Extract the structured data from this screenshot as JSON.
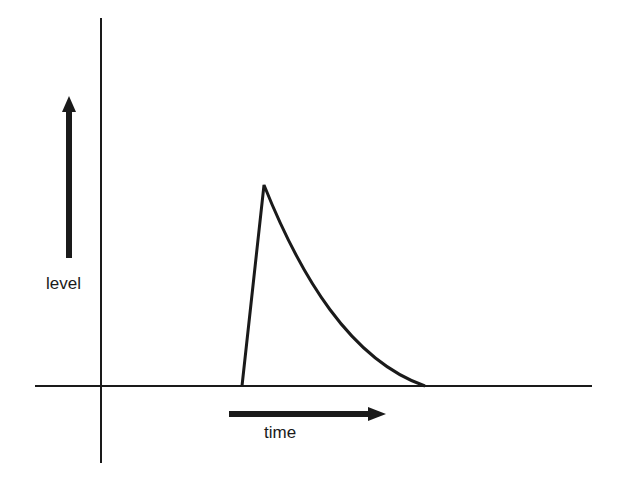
{
  "diagram": {
    "type": "pulse-level-over-time",
    "labels": {
      "y_axis": "level",
      "x_axis": "time"
    },
    "axes": {
      "vertical": {
        "x": 101,
        "y1": 18,
        "y2": 463
      },
      "horizontal": {
        "y": 386,
        "x1": 35,
        "x2": 592
      }
    },
    "pulse": {
      "start": [
        242,
        386
      ],
      "peak": [
        264,
        185
      ],
      "end": [
        425,
        386
      ],
      "shape": "fast linear rise, exponential decay"
    },
    "arrows": {
      "level_arrow": {
        "direction": "up",
        "x": 69,
        "y_from": 258,
        "y_to": 97
      },
      "time_arrow": {
        "direction": "right",
        "y": 414,
        "x_from": 229,
        "x_to": 385
      }
    },
    "colors": {
      "stroke": "#1a1a1a",
      "background": "#ffffff"
    }
  }
}
